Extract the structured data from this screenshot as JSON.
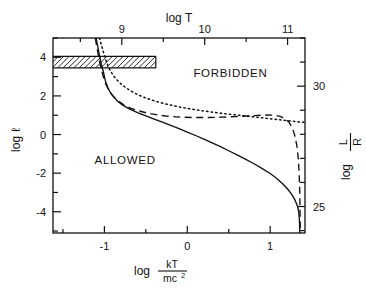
{
  "figure": {
    "background": "#ffffff",
    "ink": "#111111"
  },
  "axes": {
    "bottom": {
      "title_prefix": "log",
      "title_numerator": "kT",
      "title_denominator": "mc",
      "title_denominator_sup": "2",
      "ticks": [
        "-1",
        "0",
        "1"
      ],
      "tick_values": [
        -1,
        0,
        1
      ],
      "range": [
        -1.62,
        1.42
      ]
    },
    "top": {
      "title": "log T",
      "ticks": [
        "9",
        "10",
        "11"
      ],
      "tick_values": [
        9,
        10,
        11
      ],
      "range": [
        8.17,
        11.21
      ]
    },
    "left": {
      "title_prefix": "log",
      "title_symbol": "ℓ",
      "ticks": [
        "4",
        "2",
        "0",
        "-2",
        "-4"
      ],
      "tick_values": [
        4,
        2,
        0,
        -2,
        -4
      ],
      "range": [
        -5.1,
        5.0
      ]
    },
    "right": {
      "title_prefix": "log",
      "title_numerator": "L",
      "title_denominator": "R",
      "ticks": [
        "30",
        "25"
      ],
      "tick_values": [
        30,
        25
      ],
      "range": [
        23.9,
        32.0
      ]
    }
  },
  "annotations": [
    {
      "name": "forbidden-label",
      "text": "FORBIDDEN",
      "x": 0.52,
      "y": 3.0
    },
    {
      "name": "allowed-label",
      "text": "ALLOWED",
      "x": -0.75,
      "y": -1.55
    }
  ],
  "hatched_band": {
    "name": "hatched-constraint-band",
    "y_top": 4.05,
    "y_bottom": 3.45,
    "x_start": -1.62,
    "x_end": -0.38
  },
  "chart_data": {
    "type": "line",
    "title": "",
    "xlabel": "log kT/mc^2",
    "ylabel": "log l",
    "xlim": [
      -1.62,
      1.42
    ],
    "ylim": [
      -5.1,
      5.0
    ],
    "grid": false,
    "legend": "none",
    "top_axis": {
      "label": "log T",
      "lim": [
        8.17,
        11.21
      ]
    },
    "right_axis": {
      "label": "log L/R",
      "lim": [
        23.9,
        32.0
      ]
    },
    "series": [
      {
        "name": "solid-curve",
        "style": "solid",
        "points": [
          [
            -1.1,
            5.0
          ],
          [
            -1.08,
            4.55
          ],
          [
            -1.06,
            4.1
          ],
          [
            -1.04,
            3.7
          ],
          [
            -1.01,
            3.2
          ],
          [
            -0.99,
            2.8
          ],
          [
            -0.96,
            2.45
          ],
          [
            -0.93,
            2.18
          ],
          [
            -0.89,
            1.95
          ],
          [
            -0.84,
            1.72
          ],
          [
            -0.78,
            1.52
          ],
          [
            -0.7,
            1.33
          ],
          [
            -0.6,
            1.14
          ],
          [
            -0.5,
            0.97
          ],
          [
            -0.4,
            0.8
          ],
          [
            -0.3,
            0.64
          ],
          [
            -0.2,
            0.47
          ],
          [
            -0.1,
            0.3
          ],
          [
            0.0,
            0.13
          ],
          [
            0.1,
            -0.05
          ],
          [
            0.2,
            -0.24
          ],
          [
            0.3,
            -0.43
          ],
          [
            0.4,
            -0.63
          ],
          [
            0.5,
            -0.84
          ],
          [
            0.6,
            -1.05
          ],
          [
            0.7,
            -1.27
          ],
          [
            0.8,
            -1.5
          ],
          [
            0.9,
            -1.75
          ],
          [
            1.0,
            -2.02
          ],
          [
            1.08,
            -2.28
          ],
          [
            1.15,
            -2.55
          ],
          [
            1.21,
            -2.82
          ],
          [
            1.26,
            -3.1
          ],
          [
            1.3,
            -3.4
          ],
          [
            1.33,
            -3.72
          ],
          [
            1.345,
            -4.05
          ],
          [
            1.352,
            -4.4
          ],
          [
            1.355,
            -4.75
          ],
          [
            1.356,
            -5.1
          ]
        ]
      },
      {
        "name": "dashed-curve",
        "style": "dashed",
        "points": [
          [
            -1.11,
            5.0
          ],
          [
            -1.09,
            4.5
          ],
          [
            -1.07,
            4.05
          ],
          [
            -1.05,
            3.6
          ],
          [
            -1.02,
            3.1
          ],
          [
            -0.99,
            2.68
          ],
          [
            -0.95,
            2.32
          ],
          [
            -0.9,
            2.02
          ],
          [
            -0.84,
            1.76
          ],
          [
            -0.77,
            1.55
          ],
          [
            -0.68,
            1.36
          ],
          [
            -0.58,
            1.22
          ],
          [
            -0.47,
            1.1
          ],
          [
            -0.35,
            1.01
          ],
          [
            -0.22,
            0.94
          ],
          [
            -0.08,
            0.9
          ],
          [
            0.08,
            0.88
          ],
          [
            0.25,
            0.88
          ],
          [
            0.42,
            0.9
          ],
          [
            0.58,
            0.93
          ],
          [
            0.72,
            0.96
          ],
          [
            0.85,
            0.99
          ],
          [
            0.96,
            1.01
          ],
          [
            1.05,
            1.0
          ],
          [
            1.12,
            0.94
          ],
          [
            1.18,
            0.82
          ],
          [
            1.23,
            0.62
          ],
          [
            1.27,
            0.32
          ],
          [
            1.3,
            -0.1
          ],
          [
            1.325,
            -0.65
          ],
          [
            1.34,
            -1.3
          ],
          [
            1.35,
            -2.05
          ],
          [
            1.356,
            -2.9
          ],
          [
            1.36,
            -3.8
          ],
          [
            1.362,
            -4.5
          ],
          [
            1.363,
            -5.1
          ]
        ]
      },
      {
        "name": "dotted-curve",
        "style": "dotted",
        "points": [
          [
            -1.06,
            5.0
          ],
          [
            -1.03,
            4.55
          ],
          [
            -1.0,
            4.1
          ],
          [
            -0.97,
            3.7
          ],
          [
            -0.93,
            3.32
          ],
          [
            -0.88,
            2.98
          ],
          [
            -0.82,
            2.7
          ],
          [
            -0.75,
            2.45
          ],
          [
            -0.67,
            2.23
          ],
          [
            -0.58,
            2.03
          ],
          [
            -0.48,
            1.86
          ],
          [
            -0.37,
            1.71
          ],
          [
            -0.25,
            1.57
          ],
          [
            -0.12,
            1.45
          ],
          [
            0.02,
            1.34
          ],
          [
            0.17,
            1.24
          ],
          [
            0.32,
            1.15
          ],
          [
            0.47,
            1.07
          ],
          [
            0.62,
            1.0
          ],
          [
            0.77,
            0.93
          ],
          [
            0.9,
            0.87
          ],
          [
            1.02,
            0.81
          ],
          [
            1.12,
            0.76
          ],
          [
            1.2,
            0.72
          ],
          [
            1.27,
            0.69
          ],
          [
            1.33,
            0.66
          ],
          [
            1.38,
            0.64
          ],
          [
            1.42,
            0.63
          ]
        ]
      }
    ]
  }
}
